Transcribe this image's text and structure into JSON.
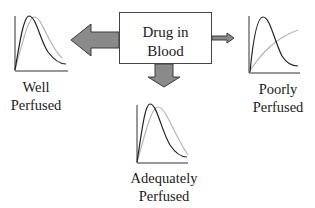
{
  "center_box": {
    "line1": "Drug in",
    "line2": "Blood"
  },
  "compartments": [
    {
      "id": "well",
      "line1": "Well",
      "line2": "Perfused",
      "arrow_size": "large"
    },
    {
      "id": "adequate",
      "line1": "Adequately",
      "line2": "Perfused",
      "arrow_size": "medium"
    },
    {
      "id": "poor",
      "line1": "Poorly",
      "line2": "Perfused",
      "arrow_size": "small"
    }
  ],
  "curves": {
    "dark_series": "drug concentration (dark curve)",
    "light_series": "drug concentration (light curve)"
  },
  "colors": {
    "arrow_fill": "#8a8a8a",
    "arrow_stroke": "#3a3a3a",
    "dark_curve": "#222222",
    "light_curve": "#b5b5b5",
    "axis": "#333333"
  }
}
